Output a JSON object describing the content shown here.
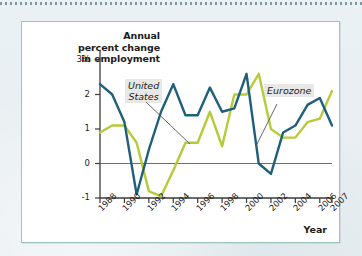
{
  "figure": {
    "frame_border_color": "#9fc3c1",
    "background_color": "#ffffff",
    "page_background_color": "#eaf1f4"
  },
  "chart_data": {
    "type": "line",
    "title": "",
    "ylabel_lines": [
      "Annual",
      "percent change",
      "in employment"
    ],
    "xlabel": "Year",
    "x": [
      1988,
      1989,
      1990,
      1991,
      1992,
      1993,
      1994,
      1995,
      1996,
      1997,
      1998,
      1999,
      2000,
      2001,
      2002,
      2003,
      2004,
      2005,
      2006,
      2007
    ],
    "xticks": [
      1988,
      1990,
      1992,
      1994,
      1996,
      1998,
      2000,
      2002,
      2004,
      2006,
      2007
    ],
    "xticklabels": [
      "1988",
      "1990",
      "1992",
      "1994",
      "1996",
      "1998",
      "2000",
      "2002",
      "2004",
      "2006",
      "2007"
    ],
    "yticks": [
      -1,
      0,
      1,
      2,
      3
    ],
    "yticklabels": [
      "-1",
      "0",
      "1",
      "2",
      "3%"
    ],
    "ylim": [
      -1,
      3
    ],
    "xlim": [
      1988,
      2007
    ],
    "grid": false,
    "zero_line": true,
    "zero_line_color": "#6d6d6d",
    "legend_position": "inline-callouts",
    "series": [
      {
        "name": "United States",
        "color": "#1f5f7a",
        "values": [
          2.3,
          2.0,
          1.2,
          -0.9,
          0.4,
          1.5,
          2.3,
          1.4,
          1.4,
          2.2,
          1.5,
          1.6,
          2.6,
          0.0,
          -0.3,
          0.9,
          1.1,
          1.7,
          1.9,
          1.1
        ]
      },
      {
        "name": "Eurozone",
        "color": "#b6cb38",
        "values": [
          0.9,
          1.1,
          1.1,
          0.6,
          -0.8,
          -0.95,
          -0.2,
          0.6,
          0.6,
          1.5,
          0.5,
          2.0,
          2.0,
          2.6,
          1.0,
          0.75,
          0.75,
          1.2,
          1.3,
          2.1
        ]
      }
    ],
    "annotations": [
      {
        "text": "United States",
        "target_series": "United States",
        "leader": true
      },
      {
        "text": "Eurozone",
        "target_series": "Eurozone",
        "leader": true
      }
    ]
  }
}
